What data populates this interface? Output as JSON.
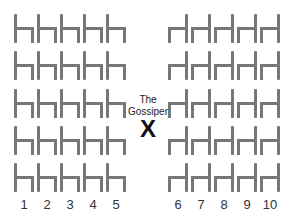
{
  "gossiper": {
    "label_line1": "The",
    "label_line2": "Gossiper",
    "marker": "X"
  },
  "columns": [
    "1",
    "2",
    "3",
    "4",
    "5",
    "6",
    "7",
    "8",
    "9",
    "10"
  ],
  "rows": 5,
  "chair_color": "#777777",
  "left_block": {
    "columns": [
      "1",
      "2",
      "3",
      "4",
      "5"
    ],
    "orientation": "back-left"
  },
  "right_block": {
    "columns": [
      "6",
      "7",
      "8",
      "9",
      "10"
    ],
    "orientation": "back-right"
  }
}
